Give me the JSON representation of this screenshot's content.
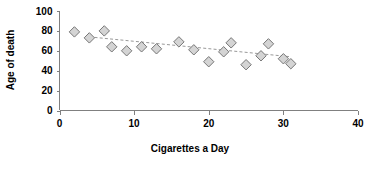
{
  "chart_data": {
    "type": "scatter",
    "title": "",
    "xlabel": "Cigarettes a Day",
    "ylabel": "Age of death",
    "xlim": [
      0,
      40
    ],
    "ylim": [
      0,
      100
    ],
    "xticks": [
      0,
      10,
      20,
      30,
      40
    ],
    "yticks": [
      0,
      20,
      40,
      60,
      80,
      100
    ],
    "xtick_labels": [
      "0",
      "10",
      "20",
      "30",
      "40"
    ],
    "ytick_labels": [
      "0",
      "20",
      "40",
      "60",
      "80",
      "100"
    ],
    "grid": false,
    "legend": false,
    "legend_position": "none",
    "marker_shape": "diamond",
    "marker_fill": "#d4d4d4",
    "marker_edge": "#767676",
    "axis_color": "#808080",
    "text_color": "#000000",
    "series": [
      {
        "name": "Age of death vs cigarettes a day",
        "points": [
          {
            "x": 2,
            "y": 79
          },
          {
            "x": 4,
            "y": 73
          },
          {
            "x": 6,
            "y": 80
          },
          {
            "x": 7,
            "y": 64
          },
          {
            "x": 9,
            "y": 60
          },
          {
            "x": 11,
            "y": 64
          },
          {
            "x": 13,
            "y": 62
          },
          {
            "x": 16,
            "y": 69
          },
          {
            "x": 18,
            "y": 61
          },
          {
            "x": 20,
            "y": 49
          },
          {
            "x": 22,
            "y": 59
          },
          {
            "x": 23,
            "y": 68
          },
          {
            "x": 25,
            "y": 46
          },
          {
            "x": 27,
            "y": 55
          },
          {
            "x": 28,
            "y": 67
          },
          {
            "x": 30,
            "y": 52
          },
          {
            "x": 31,
            "y": 47
          }
        ]
      }
    ],
    "trendline": {
      "type": "dashed",
      "color": "#999999",
      "x_start": 4,
      "y_start": 74,
      "x_end": 31,
      "y_end": 54
    },
    "annotations": []
  }
}
